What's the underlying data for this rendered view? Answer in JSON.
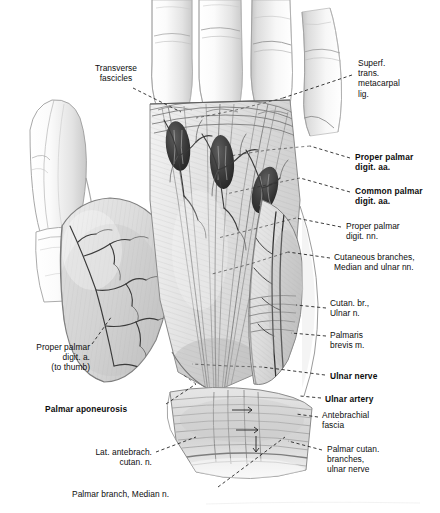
{
  "plate": {
    "title": "Palmar aponeurosis and superficial structures of the palm",
    "subject": "right hand, palmar (anterior) view, superficial dissection",
    "medium": "graphite and wash anatomical illustration, grayscale",
    "background_color": "#ffffff",
    "ink_color": "#0d0d0d",
    "wash_color": "#9a9a9a"
  },
  "labels": [
    {
      "id": "transverse-fascicles",
      "text": "Transverse\nfascicles",
      "bold": false,
      "align": "center",
      "x": 70,
      "y": 63,
      "w": 92
    },
    {
      "id": "superf-trans-metacarpal-lig",
      "text": "Superf.\ntrans.\nmetacarpal\nlig.",
      "bold": false,
      "align": "left",
      "x": 358,
      "y": 58,
      "w": 80
    },
    {
      "id": "proper-palmar-digit-aa",
      "text": "Proper palmar\ndigit. aa.",
      "bold": true,
      "align": "left",
      "x": 355,
      "y": 152,
      "w": 85
    },
    {
      "id": "common-palmar-digit-aa",
      "text": "Common palmar\ndigit. aa.",
      "bold": true,
      "align": "left",
      "x": 355,
      "y": 186,
      "w": 85
    },
    {
      "id": "proper-palmar-digit-nn",
      "text": "Proper palmar\ndigit. nn.",
      "bold": false,
      "align": "left",
      "x": 346,
      "y": 221,
      "w": 88
    },
    {
      "id": "cutaneous-branches-median-ulnar",
      "text": "Cutaneous branches,\nMedian and ulnar nn.",
      "bold": false,
      "align": "left",
      "x": 334,
      "y": 252,
      "w": 104
    },
    {
      "id": "cutan-br-ulnar-n",
      "text": "Cutan. br.,\nUlnar n.",
      "bold": false,
      "align": "left",
      "x": 330,
      "y": 298,
      "w": 70
    },
    {
      "id": "palmaris-brevis-m",
      "text": "Palmaris\nbrevis m.",
      "bold": false,
      "align": "left",
      "x": 330,
      "y": 330,
      "w": 70
    },
    {
      "id": "ulnar-nerve",
      "text": "Ulnar nerve",
      "bold": true,
      "align": "left",
      "x": 330,
      "y": 371,
      "w": 74
    },
    {
      "id": "ulnar-artery",
      "text": "Ulnar artery",
      "bold": true,
      "align": "left",
      "x": 325,
      "y": 394,
      "w": 76
    },
    {
      "id": "antebrachial-fascia",
      "text": "Antebrachial\nfascia",
      "bold": false,
      "align": "left",
      "x": 322,
      "y": 410,
      "w": 80
    },
    {
      "id": "palmar-cutan-branches-ulnar-nerve",
      "text": "Palmar cutan.\nbranches,\nulnar nerve",
      "bold": false,
      "align": "left",
      "x": 327,
      "y": 444,
      "w": 80
    },
    {
      "id": "proper-palmar-digit-a-to-thumb",
      "text": "Proper palmar\ndigit. a.\n(to thumb)",
      "bold": false,
      "align": "right",
      "x": 14,
      "y": 342,
      "w": 76
    },
    {
      "id": "palmar-aponeurosis",
      "text": "Palmar aponeurosis",
      "bold": true,
      "align": "left",
      "x": 45,
      "y": 404,
      "w": 118
    },
    {
      "id": "lat-antebrach-cutan-n",
      "text": "Lat. antebrach.\ncutan. n.",
      "bold": false,
      "align": "right",
      "x": 72,
      "y": 447,
      "w": 80
    },
    {
      "id": "palmar-branch-median-n",
      "text": "Palmar branch, Median n.",
      "bold": false,
      "align": "left",
      "x": 72,
      "y": 489,
      "w": 142
    }
  ],
  "leaders": [
    {
      "id": "leader-transverse-fascicles",
      "from": [
        133,
        88
      ],
      "to": [
        181,
        112
      ]
    },
    {
      "id": "leader-superf-trans-metacarpal-lig",
      "from": [
        352,
        75
      ],
      "to": [
        283,
        98
      ]
    },
    {
      "id": "leader-proper-palmar-digit-aa",
      "from": [
        350,
        158
      ],
      "to": [
        310,
        146
      ]
    },
    {
      "id": "leader-common-palmar-digit-aa",
      "from": [
        350,
        192
      ],
      "to": [
        300,
        178
      ]
    },
    {
      "id": "leader-proper-palmar-digit-nn",
      "from": [
        341,
        227
      ],
      "to": [
        296,
        218
      ]
    },
    {
      "id": "leader-cutaneous-branches",
      "from": [
        330,
        258
      ],
      "to": [
        288,
        252
      ]
    },
    {
      "id": "leader-cutan-br-ulnar-n",
      "from": [
        326,
        308
      ],
      "to": [
        296,
        305
      ]
    },
    {
      "id": "leader-palmaris-brevis-m",
      "from": [
        326,
        336
      ],
      "to": [
        291,
        333
      ]
    },
    {
      "id": "leader-ulnar-nerve",
      "from": [
        325,
        375
      ],
      "to": [
        262,
        367
      ]
    },
    {
      "id": "leader-ulnar-artery",
      "from": [
        321,
        398
      ],
      "to": [
        300,
        396
      ]
    },
    {
      "id": "leader-antebrachial-fascia",
      "from": [
        318,
        417
      ],
      "to": [
        296,
        414
      ]
    },
    {
      "id": "leader-palmar-cutan-branches",
      "from": [
        322,
        450
      ],
      "to": [
        288,
        441
      ]
    },
    {
      "id": "leader-proper-palmar-digit-a",
      "from": [
        92,
        344
      ],
      "to": [
        112,
        316
      ]
    },
    {
      "id": "leader-palmar-aponeurosis",
      "from": [
        166,
        404
      ],
      "to": [
        196,
        384
      ]
    },
    {
      "id": "leader-lat-antebrach-cutan-n",
      "from": [
        156,
        452
      ],
      "to": [
        196,
        437
      ]
    },
    {
      "id": "leader-palmar-branch-median-n",
      "from": [
        218,
        487
      ],
      "to": [
        285,
        437
      ]
    }
  ],
  "anatomy": {
    "digits": [
      {
        "id": "digit-2-index",
        "label": "index finger"
      },
      {
        "id": "digit-3-middle",
        "label": "middle finger"
      },
      {
        "id": "digit-4-ring",
        "label": "ring finger"
      },
      {
        "id": "digit-5-little",
        "label": "little finger"
      },
      {
        "id": "digit-1-thumb",
        "label": "thumb"
      }
    ],
    "regions": [
      {
        "id": "thenar-eminence",
        "label": "thenar eminence"
      },
      {
        "id": "hypothenar-eminence",
        "label": "hypothenar eminence"
      },
      {
        "id": "palmar-aponeurosis-body",
        "label": "palmar aponeurosis"
      },
      {
        "id": "wrist-forearm",
        "label": "distal forearm and wrist"
      }
    ],
    "interdigital_spaces": 4
  }
}
